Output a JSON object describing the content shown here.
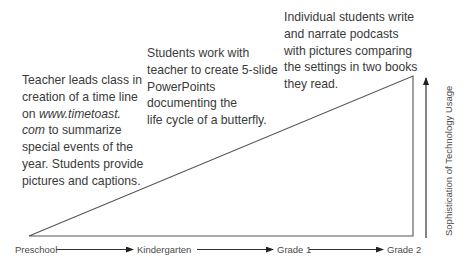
{
  "activities": [
    {
      "stage": "Preschool",
      "lines": [
        "Teacher leads class in",
        "creation of a time line",
        "on ",
        "www.timetoast.",
        "com",
        " to summarize",
        "special events of the",
        "year. Students provide",
        "pictures and captions."
      ],
      "line1": "Teacher leads class in",
      "line2": "creation of a time line",
      "line3_prefix": "on ",
      "line3_italic": "www.timetoast.",
      "line4_italic": "com",
      "line4_suffix": " to summarize",
      "line5": "special events of the",
      "line6": "year. Students provide",
      "line7": "pictures and captions."
    },
    {
      "stage": "Kindergarten",
      "line1": "Students work with",
      "line2": "teacher to create 5-slide",
      "line3": "PowerPoints",
      "line4": "documenting the",
      "line5": "life cycle of a butterfly."
    },
    {
      "stage": "Grade 1",
      "line1": "Individual students write",
      "line2": "and narrate podcasts",
      "line3": "with pictures comparing",
      "line4": "the settings in two books",
      "line5": "they read."
    }
  ],
  "timeline": {
    "stages": [
      "Preschool",
      "Kindergarten",
      "Grade 1",
      "Grade 2"
    ]
  },
  "y_axis": {
    "label": "Sophistication of Technology Usage"
  },
  "colors": {
    "line": "#555555",
    "text": "#3a3a3a"
  }
}
